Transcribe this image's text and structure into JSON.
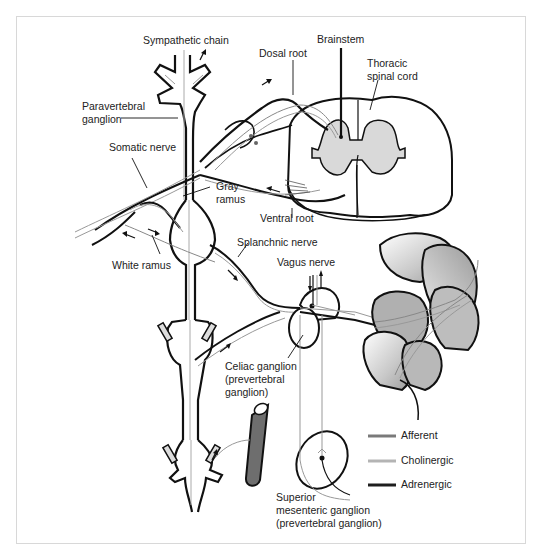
{
  "figure": {
    "labels": {
      "sympathetic_chain": "Sympathetic chain",
      "dosal_root": "Dosal root",
      "brainstem": "Brainstem",
      "thoracic_spinal_cord": "Thoracic\nspinal cord",
      "paravertebral_ganglion": "Paravertebral\nganglion",
      "somatic_nerve": "Somatic nerve",
      "gray_ramus": "Gray\nramus",
      "ventral_root": "Ventral root",
      "splanchnic_nerve": "Splanchnic nerve",
      "white_ramus": "White ramus",
      "vagus_nerve": "Vagus nerve",
      "celiac_ganglion": "Celiac ganglion\n(prevertebral\nganglion)",
      "superior_mesenteric_ganglion": "Superior\nmesenteric ganglion\n(prevertebral ganglion)"
    },
    "legend": [
      {
        "label": "Afferent",
        "color": "#7a7a7a"
      },
      {
        "label": "Cholinergic",
        "color": "#b4b4b4"
      },
      {
        "label": "Adrenergic",
        "color": "#1e1e1e"
      }
    ],
    "colors": {
      "outline": "#111111",
      "gray_matter": "#d9d9d9",
      "intestine": "#a8a8a8",
      "blood_vessel": "#6e6e6e",
      "frame_border": "#d8d8d8"
    }
  }
}
